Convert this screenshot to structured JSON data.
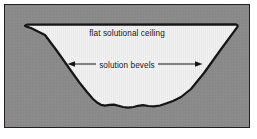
{
  "figure": {
    "type": "geological-cross-section",
    "caption_labels": {
      "ceiling": "flat solutional ceiling",
      "bevels": "solution bevels"
    },
    "colors": {
      "bedrock_fill": "#8a8a8a",
      "void_fill": "#f0f0f0",
      "outline": "#151515",
      "frame_border": "#231f20",
      "page_background": "#ffffff",
      "text": "#151515",
      "arrow": "#151515"
    },
    "frame": {
      "x": 4,
      "y": 4,
      "width": 246,
      "height": 124,
      "border_width": 1
    },
    "annotations": [
      {
        "name": "ceiling-label",
        "text": "flat solutional ceiling",
        "has_arrows": false
      },
      {
        "name": "bevels-label",
        "text": "solution bevels",
        "has_arrows": true,
        "arrow_direction": "double-ended-outward",
        "left_arrow": {
          "from_x": 141,
          "to_x": 66,
          "y": 63
        },
        "right_arrow": {
          "from_x": 148,
          "to_x": 198,
          "y": 63
        }
      }
    ],
    "shape": {
      "name": "cave-passage-void",
      "description": "trapezoidal solution void with flat ceiling, straight bevelled sides and irregular rough floor",
      "outline_width": 2.2,
      "vertices": {
        "ceiling_left": [
          20,
          20
        ],
        "ceiling_right": [
          232,
          20
        ],
        "floor_left": [
          92,
          99
        ],
        "floor_right": [
          160,
          99
        ]
      },
      "path": "M 20 21 L 20.5 20.3 L 22.5 19.6 L 231.0 19.4 L 232.4 20.2 L 232.6 21.6 L 214 47 L 199 68 L 186 84 L 176 92 L 168 96 L 161 98.5 L 155 100.5 L 149 101.4 L 143.5 101.0 L 138 100.2 L 133 100.8 L 128.5 102.0 L 123 102.6 L 118 102.0 L 113.5 100.8 L 109 99.6 L 104.5 99.9 L 100 100.6 L 96 99.8 L 92.5 97.8 L 88 94 L 82 87 L 74 77 L 64 63 L 52 46 L 40 30 L 26 23 L 21.5 21.6 Z"
    }
  }
}
